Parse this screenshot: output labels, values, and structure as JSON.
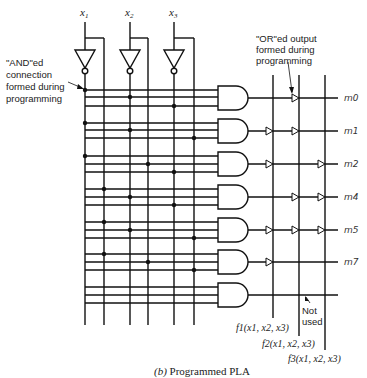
{
  "diagram": {
    "title": "Programmed PLA",
    "caption_prefix": "(b)",
    "caption_text": "Programmed PLA",
    "inputs": [
      {
        "label": "x",
        "sub": "1"
      },
      {
        "label": "x",
        "sub": "2"
      },
      {
        "label": "x",
        "sub": "3"
      }
    ],
    "annotations": {
      "and_note": [
        "\"AND\"ed",
        "connection",
        "formed during",
        "programming"
      ],
      "or_note": [
        "\"OR\"ed output",
        "formed during",
        "programming"
      ],
      "not_used": [
        "Not",
        "used"
      ]
    },
    "minterm_labels": [
      "m0",
      "m1",
      "m2",
      "m4",
      "m5",
      "m7"
    ],
    "outputs": [
      {
        "label": "f1(x1, x2, x3)"
      },
      {
        "label": "f2(x1, x2, x3)"
      },
      {
        "label": "f3(x1, x2, x3)"
      }
    ],
    "and_connections": [
      {
        "gate": "m0",
        "literals": [
          "x1'",
          "x2'",
          "x3'"
        ]
      },
      {
        "gate": "m1",
        "literals": [
          "x1'",
          "x2'",
          "x3"
        ]
      },
      {
        "gate": "m2",
        "literals": [
          "x1'",
          "x2",
          "x3'"
        ]
      },
      {
        "gate": "m4",
        "literals": [
          "x1",
          "x2'",
          "x3'"
        ]
      },
      {
        "gate": "m5",
        "literals": [
          "x1",
          "x2'",
          "x3"
        ]
      },
      {
        "gate": "m7",
        "literals": [
          "x1",
          "x2",
          "x3"
        ]
      },
      {
        "gate": "unused",
        "literals": []
      }
    ],
    "or_connections": {
      "f1": [
        "m1",
        "m2",
        "m5",
        "m7"
      ],
      "f2": [
        "m0",
        "m1",
        "m4",
        "m5"
      ],
      "f3": [
        "m2",
        "m4",
        "m5"
      ]
    }
  }
}
